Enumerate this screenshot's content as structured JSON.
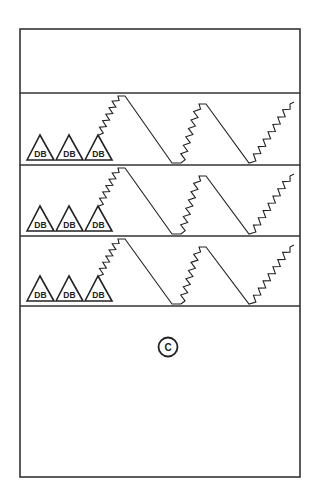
{
  "diagram": {
    "type": "patent-figure",
    "frame": {
      "x": 20,
      "y": 29,
      "width": 280,
      "height": 448
    },
    "row_dividers_y": [
      93,
      165,
      236,
      306
    ],
    "rows": [
      {
        "id": "row-1",
        "top": 93,
        "bottom": 165,
        "triangles": [
          {
            "label": "DB"
          },
          {
            "label": "DB"
          },
          {
            "label": "DB"
          }
        ],
        "waveform": "zigzag-sawtooth"
      },
      {
        "id": "row-2",
        "top": 165,
        "bottom": 236,
        "triangles": [
          {
            "label": "DB"
          },
          {
            "label": "DB"
          },
          {
            "label": "DB"
          }
        ],
        "waveform": "zigzag-sawtooth"
      },
      {
        "id": "row-3",
        "top": 236,
        "bottom": 306,
        "triangles": [
          {
            "label": "DB"
          },
          {
            "label": "DB"
          },
          {
            "label": "DB"
          }
        ],
        "waveform": "zigzag-sawtooth"
      }
    ],
    "bottom_panel": {
      "marker": {
        "label": "C",
        "shape": "circle"
      }
    },
    "colors": {
      "line": "#222222",
      "background": "#ffffff"
    }
  }
}
